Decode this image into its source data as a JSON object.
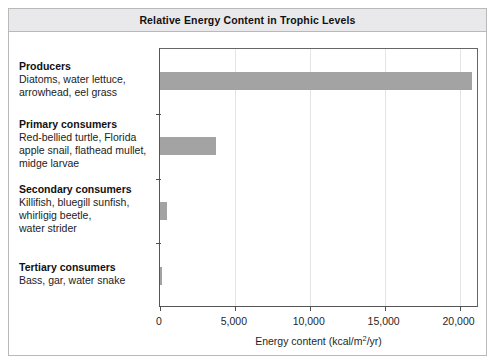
{
  "figure": {
    "title": "Relative Energy Content in Trophic Levels"
  },
  "chart_data": {
    "type": "bar",
    "orientation": "horizontal",
    "title": "Relative Energy Content in Trophic Levels",
    "xlabel": "Energy content (kcal/m2/yr)",
    "xlabel_parts": {
      "pre": "Energy content (kcal/m",
      "sup": "2",
      "post": "/yr)"
    },
    "ylabel": "",
    "categories": [
      "Producers",
      "Primary consumers",
      "Secondary consumers",
      "Tertiary consumers"
    ],
    "values": [
      20810,
      3770,
      460,
      130
    ],
    "xlim": [
      0,
      21300
    ],
    "xticks": [
      0,
      5000,
      10000,
      15000,
      20000
    ],
    "xticklabels": [
      "0",
      "5,000",
      "10,000",
      "15,000",
      "20,000"
    ],
    "grid": "vertical",
    "legend": "none",
    "bar_color": "#a3a3a3"
  },
  "categories": [
    {
      "heading": "Producers",
      "description": "Diatoms, water lettuce,\narrowhead, eel grass",
      "desc_lines": [
        "Diatoms, water lettuce,",
        "arrowhead, eel grass"
      ],
      "value": 20810
    },
    {
      "heading": "Primary consumers",
      "description": "Red-bellied turtle, Florida\napple snail, flathead mullet,\nmidge larvae",
      "desc_lines": [
        "Red-bellied turtle, Florida",
        "apple snail, flathead mullet,",
        "midge larvae"
      ],
      "value": 3770
    },
    {
      "heading": "Secondary consumers",
      "description": "Killifish, bluegill sunfish,\nwhirligig beetle,\nwater strider",
      "desc_lines": [
        "Killifish, bluegill sunfish,",
        "whirligig beetle,",
        "water strider"
      ],
      "value": 460
    },
    {
      "heading": "Tertiary consumers",
      "description": "Bass, gar, water snake",
      "desc_lines": [
        "Bass, gar, water snake"
      ],
      "value": 130
    }
  ],
  "colors": {
    "bar": "#a3a3a3",
    "title_band": "#e9e9ec",
    "border": "#b9b9b9",
    "axis": "#4d4d4d",
    "gridline": "#e3e3e8"
  }
}
